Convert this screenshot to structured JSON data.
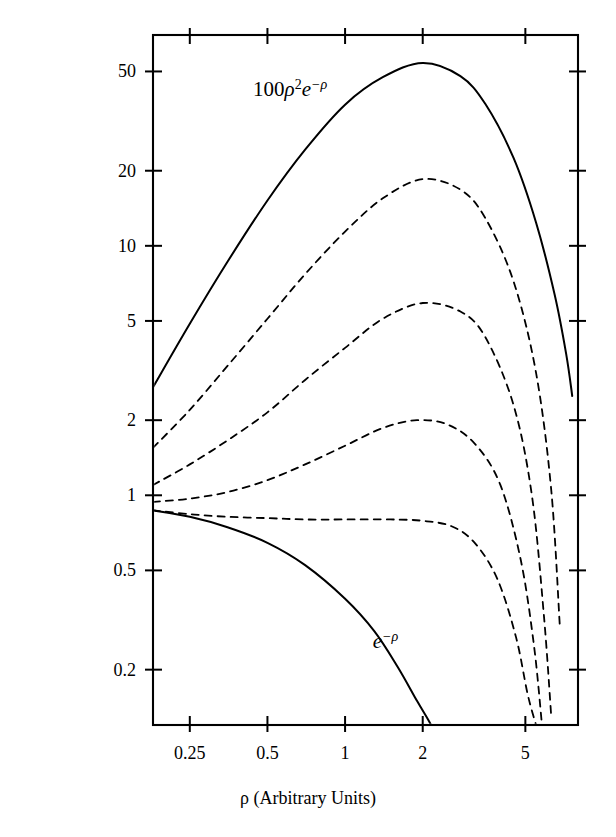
{
  "figure": {
    "background": "#ffffff",
    "ink": "#000000"
  },
  "axes": {
    "x": {
      "label": "ρ (Arbitrary Units)",
      "scale": "log",
      "range": [
        0.18,
        8.0
      ],
      "ticks": [
        0.25,
        0.5,
        1,
        2,
        5
      ],
      "ticklabels": [
        "0.25",
        "0.5",
        "1",
        "2",
        "5"
      ]
    },
    "y": {
      "label": "SENSITIVITY (Arbitrary Units)",
      "scale": "log",
      "range": [
        0.12,
        70
      ],
      "ticks": [
        0.2,
        0.5,
        1,
        2,
        5,
        10,
        20,
        50
      ],
      "ticklabels": [
        "0.2",
        "0.5",
        "1",
        "2",
        "5",
        "10",
        "20",
        "50"
      ]
    },
    "frame": "box",
    "ticks_mirrored": true,
    "grid": false
  },
  "annotations": [
    {
      "name": "upper-curve-label",
      "text_html": "100ρ²e⁻ρ",
      "base": "100",
      "rho": "ρ",
      "exp": "2",
      "e": "e",
      "esup": "−ρ",
      "x": 0.44,
      "y": 40.0
    },
    {
      "name": "lower-curve-label",
      "text_html": "e⁻ρ",
      "e": "e",
      "esup": "−ρ",
      "x": 1.28,
      "y": 0.245
    }
  ],
  "chart_data": {
    "type": "line",
    "title": "",
    "xlabel": "ρ (Arbitrary Units)",
    "ylabel": "SENSITIVITY (Arbitrary Units)",
    "xscale": "log",
    "yscale": "log",
    "xlim": [
      0.18,
      8.0
    ],
    "ylim": [
      0.12,
      70
    ],
    "grid": false,
    "legend": "none",
    "series": [
      {
        "name": "100 rho^2 exp(-rho)",
        "label": "100ρ²e⁻ρ",
        "style": "solid",
        "width": 2.0,
        "n": 2,
        "scale": 100,
        "peak": {
          "x": 2.0,
          "y": 54.1
        },
        "x": [
          0.18,
          0.25,
          0.35,
          0.5,
          0.7,
          1.0,
          1.4,
          2.0,
          2.8,
          3.5,
          4.5,
          5.5,
          6.5,
          7.2,
          7.6
        ],
        "y": [
          2.71,
          4.87,
          8.63,
          15.2,
          24.3,
          36.8,
          47.4,
          54.1,
          47.9,
          37.0,
          22.5,
          12.4,
          6.35,
          3.68,
          2.5
        ]
      },
      {
        "name": "curve-2-dashed",
        "style": "dashed",
        "width": 1.8,
        "peak": {
          "x": 2.0,
          "y": 18.5
        },
        "x": [
          0.18,
          0.25,
          0.35,
          0.5,
          0.7,
          1.0,
          1.4,
          2.0,
          2.8,
          3.5,
          4.5,
          5.5,
          6.3,
          6.8
        ],
        "y": [
          1.55,
          2.2,
          3.3,
          5.1,
          7.7,
          11.4,
          15.5,
          18.5,
          16.8,
          12.9,
          7.2,
          3.1,
          1.05,
          0.3
        ]
      },
      {
        "name": "curve-3-dashed",
        "style": "dashed",
        "width": 1.8,
        "peak": {
          "x": 2.0,
          "y": 5.9
        },
        "x": [
          0.18,
          0.25,
          0.35,
          0.5,
          0.7,
          1.0,
          1.4,
          2.0,
          2.8,
          3.5,
          4.5,
          5.3,
          5.9,
          6.3
        ],
        "y": [
          1.1,
          1.33,
          1.66,
          2.15,
          2.9,
          3.9,
          5.1,
          5.9,
          5.45,
          4.3,
          2.3,
          1.0,
          0.33,
          0.13
        ]
      },
      {
        "name": "curve-4-dashed",
        "style": "dashed",
        "width": 1.8,
        "peak": {
          "x": 1.9,
          "y": 2.0
        },
        "x": [
          0.18,
          0.25,
          0.35,
          0.5,
          0.7,
          1.0,
          1.4,
          1.9,
          2.5,
          3.2,
          4.0,
          4.8,
          5.4,
          5.8
        ],
        "y": [
          0.94,
          0.97,
          1.03,
          1.15,
          1.33,
          1.58,
          1.86,
          2.0,
          1.92,
          1.6,
          1.1,
          0.55,
          0.25,
          0.12
        ]
      },
      {
        "name": "curve-5-dashed",
        "style": "dashed",
        "width": 1.8,
        "peak": {
          "x": 1.0,
          "y": 0.8
        },
        "x": [
          0.18,
          0.25,
          0.35,
          0.5,
          0.7,
          1.0,
          1.5,
          2.0,
          2.6,
          3.2,
          3.9,
          4.6,
          5.1,
          5.5
        ],
        "y": [
          0.87,
          0.84,
          0.82,
          0.81,
          0.8,
          0.8,
          0.8,
          0.79,
          0.75,
          0.64,
          0.46,
          0.27,
          0.16,
          0.12
        ]
      },
      {
        "name": "exp(-rho)",
        "label": "e⁻ρ",
        "style": "solid",
        "width": 2.0,
        "x": [
          0.18,
          0.25,
          0.35,
          0.5,
          0.7,
          1.0,
          1.3,
          1.6,
          1.9,
          2.1,
          2.2
        ],
        "y": [
          0.87,
          0.82,
          0.745,
          0.645,
          0.525,
          0.385,
          0.285,
          0.205,
          0.15,
          0.126,
          0.115
        ]
      }
    ]
  }
}
